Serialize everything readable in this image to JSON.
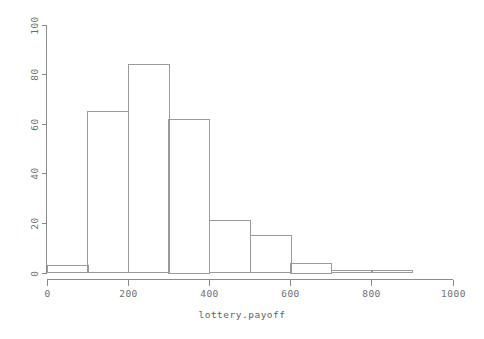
{
  "chart_data": {
    "type": "bar",
    "title": "",
    "subtitle": "",
    "xlabel": "lottery.payoff",
    "ylabel": "",
    "xlim": [
      0,
      1000
    ],
    "ylim": [
      0,
      100
    ],
    "grid": false,
    "legend": null,
    "bin_width": 100,
    "bin_edges": [
      0,
      100,
      200,
      300,
      400,
      500,
      600,
      700,
      800,
      900
    ],
    "categories": [
      "0-100",
      "100-200",
      "200-300",
      "300-400",
      "400-500",
      "500-600",
      "600-700",
      "700-800",
      "800-900"
    ],
    "values": [
      3,
      65,
      84,
      62,
      21,
      15,
      4,
      1,
      1
    ],
    "xticks": [
      0,
      200,
      400,
      600,
      800,
      1000
    ],
    "xtick_labels": [
      "0",
      "200",
      "400",
      "600",
      "800",
      "1000"
    ],
    "yticks": [
      0,
      20,
      40,
      60,
      80,
      100
    ],
    "ytick_labels": [
      "0",
      "20",
      "40",
      "60",
      "80",
      "100"
    ],
    "bar_stroke_color": "#9a9a9a",
    "bar_fill_color": "none",
    "axis_color": "#8a8a8a",
    "background_color": "#ffffff"
  },
  "axes": {
    "x_title": "lottery.payoff",
    "y_title": ""
  }
}
